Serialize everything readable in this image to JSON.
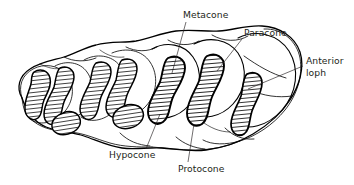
{
  "figure": {
    "kind": "anatomical-line-drawing",
    "style": "black ink line art with hatched enamel bands on white background",
    "background_color": "#ffffff",
    "ink_color": "#000000",
    "text_color": "#231f20",
    "canvas": {
      "width": 354,
      "height": 185
    }
  },
  "labels": [
    {
      "id": "metacone",
      "text": "Metacone",
      "text_x": 183,
      "text_y": 18,
      "anchor": "start",
      "leader": {
        "x1": 186,
        "y1": 22,
        "x2": 172,
        "y2": 73
      }
    },
    {
      "id": "paracone",
      "text": "Paracone",
      "text_x": 244,
      "text_y": 36,
      "anchor": "start",
      "leader": {
        "x1": 242,
        "y1": 39,
        "x2": 217,
        "y2": 71
      }
    },
    {
      "id": "anterior-loph",
      "text_line1": "Anterior",
      "text_line2": "loph",
      "text_x": 306,
      "text_y": 64,
      "anchor": "start",
      "leader": {
        "x1": 303,
        "y1": 66,
        "x2": 248,
        "y2": 89
      }
    },
    {
      "id": "hypocone",
      "text": "Hypocone",
      "text_x": 109,
      "text_y": 158,
      "anchor": "start",
      "leader": {
        "x1": 160,
        "y1": 114,
        "x2": 146,
        "y2": 149
      }
    },
    {
      "id": "protocone",
      "text": "Protocone",
      "text_x": 178,
      "text_y": 172,
      "anchor": "start",
      "leader": {
        "x1": 194,
        "y1": 124,
        "x2": 188,
        "y2": 162
      }
    }
  ],
  "tooth": {
    "description": "Elongated crown running lower-left to upper-right, composed of overlapping rounded cusp lobes with four S-shaped hatched enamel lophs plus smaller accessory hatched islands.",
    "lophs": [
      {
        "id": "loph-1",
        "position": "left-most",
        "shading": "hatched"
      },
      {
        "id": "loph-2",
        "position": "second",
        "shading": "hatched"
      },
      {
        "id": "loph-3",
        "position": "metacone-loph",
        "shading": "hatched"
      },
      {
        "id": "loph-4",
        "position": "paracone-loph",
        "shading": "hatched"
      },
      {
        "id": "loph-5",
        "position": "anterior-loph",
        "shading": "hatched"
      }
    ]
  }
}
